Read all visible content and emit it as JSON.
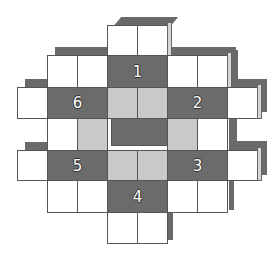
{
  "figure": {
    "type": "cube-net-puzzle",
    "colors": {
      "white": "#ffffff",
      "light": "#c9c9c9",
      "dark": "#6b6b6b",
      "shadow": "#6a6a6a"
    },
    "faces": [
      {
        "id": "face-1",
        "label": "1"
      },
      {
        "id": "face-2",
        "label": "2"
      },
      {
        "id": "face-3",
        "label": "3"
      },
      {
        "id": "face-4",
        "label": "4"
      },
      {
        "id": "face-5",
        "label": "5"
      },
      {
        "id": "face-6",
        "label": "6"
      }
    ],
    "grid": {
      "cell_size": 30,
      "rows": [
        [
          "",
          "",
          "",
          "W",
          "W",
          "",
          "",
          ""
        ],
        [
          "",
          "W",
          "W",
          "D1",
          "D1",
          "W",
          "W",
          ""
        ],
        [
          "W",
          "D6",
          "D6",
          "L",
          "L",
          "D2",
          "D2",
          "W"
        ],
        [
          "",
          "W",
          "L",
          "D",
          "D",
          "L",
          "W",
          ""
        ],
        [
          "W",
          "D5",
          "D5",
          "L",
          "L",
          "D3",
          "D3",
          "W"
        ],
        [
          "",
          "W",
          "W",
          "D4",
          "D4",
          "W",
          "W",
          ""
        ],
        [
          "",
          "",
          "",
          "W",
          "W",
          "",
          "",
          ""
        ]
      ]
    }
  }
}
